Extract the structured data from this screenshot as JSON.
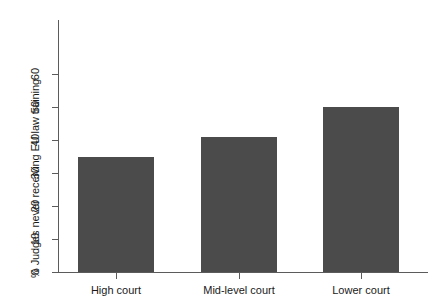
{
  "chart_data": {
    "type": "bar",
    "title": "",
    "subtitle": "",
    "xlabel": "",
    "ylabel": "% Judges never receiving EU law training",
    "categories": [
      "High court",
      "Mid-level court",
      "Lower court"
    ],
    "values": [
      35,
      41,
      50
    ],
    "series": [
      {
        "name": "% Judges never receiving EU law training",
        "values": [
          35,
          41,
          50
        ]
      }
    ],
    "ylim": [
      0,
      65
    ],
    "yticks": [
      0,
      10,
      20,
      30,
      40,
      50,
      60
    ],
    "ytick_labels": [
      "0",
      "10",
      "20",
      "30",
      "40",
      "50",
      "60"
    ],
    "grid": false,
    "legend": false,
    "legend_position": "none",
    "bar_color": "#4b4b4b",
    "axis_color": "#5b5b5b",
    "background_color": "#ffffff",
    "annotations": []
  },
  "axis": {
    "y_title": "% Judges never receiving EU law training"
  }
}
